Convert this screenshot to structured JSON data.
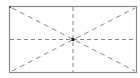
{
  "diagram": {
    "rectangle": {
      "x": 9,
      "y": 6,
      "width": 128,
      "height": 67,
      "stroke": "#8a8a8a"
    },
    "guides": {
      "stroke": "#7a7a7a",
      "dash": "4 3",
      "horizontal_midline": true,
      "vertical_midline": true,
      "diagonals": true
    },
    "center_point": {
      "x": 73,
      "y": 39.5,
      "color": "#222222"
    },
    "corner_marker": {
      "x": 10,
      "y": 7,
      "color": "#555555"
    }
  }
}
